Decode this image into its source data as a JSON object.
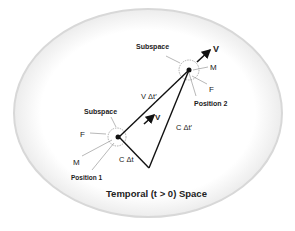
{
  "diagram": {
    "title": "Temporal (t > 0) Space",
    "position1": {
      "subspace_label": "Subspace",
      "f_label": "F",
      "m_label": "M",
      "position_label": "Position 1"
    },
    "position2": {
      "subspace_label": "Subspace",
      "v_label": "V",
      "m_label": "M",
      "f_label": "F",
      "position_label": "Position 2"
    },
    "edges": {
      "v_dt_prime": "V Δt′",
      "mid_v": "V",
      "c_dt_prime": "C Δt′",
      "c_dt": "C Δt"
    }
  }
}
